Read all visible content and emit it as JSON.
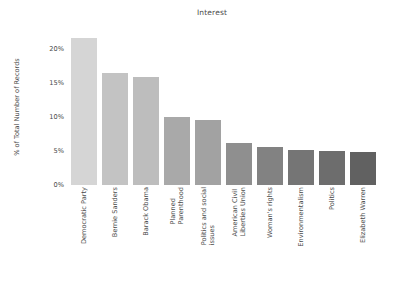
{
  "chart_data": {
    "type": "bar",
    "title": "Interest",
    "xlabel": "",
    "ylabel": "% of Total Number of Records",
    "categories": [
      "Democratic Party",
      "Bernie Sanders",
      "Barack Obama",
      "Planned Parenthood",
      "Politics and social issues",
      "American Civil Liberties Union",
      "Woman's rights",
      "Environmentalism",
      "Politics",
      "Elizabeth Warren"
    ],
    "category_lines": [
      [
        "Democratic Party"
      ],
      [
        "Bernie Sanders"
      ],
      [
        "Barack Obama"
      ],
      [
        "Planned",
        "Parenthood"
      ],
      [
        "Politics and social",
        "issues"
      ],
      [
        "American Civil",
        "Liberties Union"
      ],
      [
        "Woman's rights"
      ],
      [
        "Environmentalism"
      ],
      [
        "Politics"
      ],
      [
        "Elizabeth Warren"
      ]
    ],
    "values": [
      21.6,
      16.5,
      15.9,
      10.0,
      9.5,
      6.1,
      5.6,
      5.2,
      5.0,
      4.9
    ],
    "value_labels": [
      "21.6%",
      "16.5%",
      "15.9%",
      "10.0%",
      "9.5%",
      "6.1%",
      "5.6%",
      "5.2%",
      "5.0%",
      "4.9%"
    ],
    "bar_colors": [
      "#d5d5d5",
      "#c3c3c3",
      "#bdbdbd",
      "#a9a9a9",
      "#a2a2a2",
      "#8f8f8f",
      "#828282",
      "#757575",
      "#6d6d6d",
      "#616161"
    ],
    "ylim": [
      0,
      23.5
    ],
    "yticks": [
      0,
      5,
      10,
      15,
      20
    ],
    "ytick_labels": [
      "0%",
      "5%",
      "10%",
      "15%",
      "20%"
    ],
    "grid": false,
    "legend": null,
    "xtick_rotation": 90
  }
}
